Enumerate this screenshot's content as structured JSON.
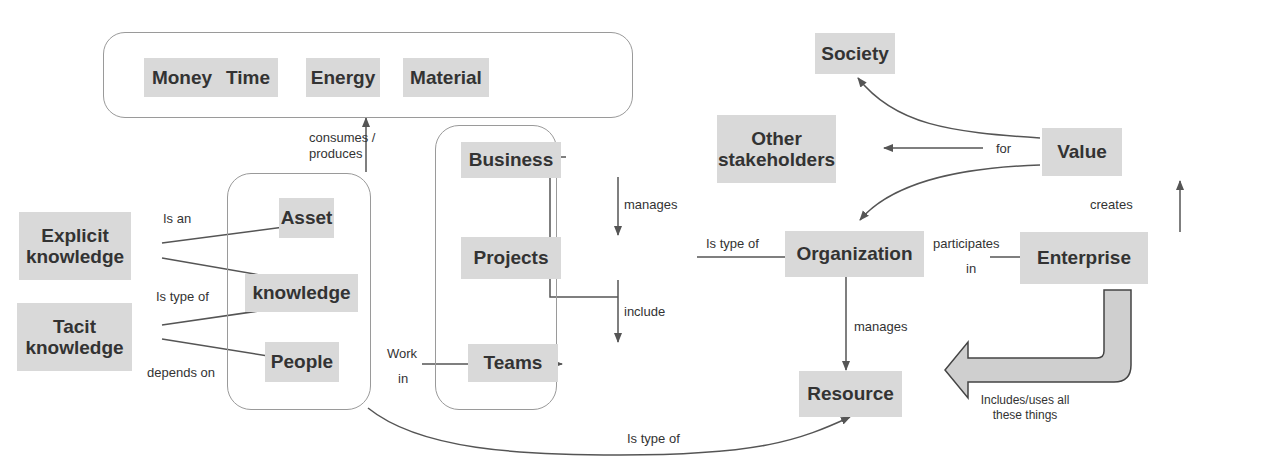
{
  "diagram": {
    "resources_group": {
      "items": [
        "Money",
        "Time",
        "Energy",
        "Material"
      ]
    },
    "people_group": {
      "asset": "Asset",
      "knowledge": "knowledge",
      "people": "People"
    },
    "business_group": {
      "business": "Business",
      "projects": "Projects",
      "teams": "Teams"
    },
    "nodes": {
      "explicit_knowledge": "Explicit knowledge",
      "tacit_knowledge": "Tacit knowledge",
      "society": "Society",
      "other_stakeholders": "Other stakeholders",
      "value": "Value",
      "organization": "Organization",
      "enterprise": "Enterprise",
      "resource": "Resource"
    },
    "edge_labels": {
      "consumes_produces": "consumes / produces",
      "is_an": "Is an",
      "is_type_of_knowledge": "Is type of",
      "depends_on": "depends on",
      "work_in_1": "Work",
      "work_in_2": "in",
      "manages_projects": "manages",
      "include": "include",
      "is_type_of_org": "Is type of",
      "participates_1": "participates",
      "participates_2": "in",
      "for": "for",
      "creates": "creates",
      "manages_resource": "manages",
      "is_type_of_resource": "Is type of",
      "includes_uses": "Includes/uses all these things"
    }
  }
}
